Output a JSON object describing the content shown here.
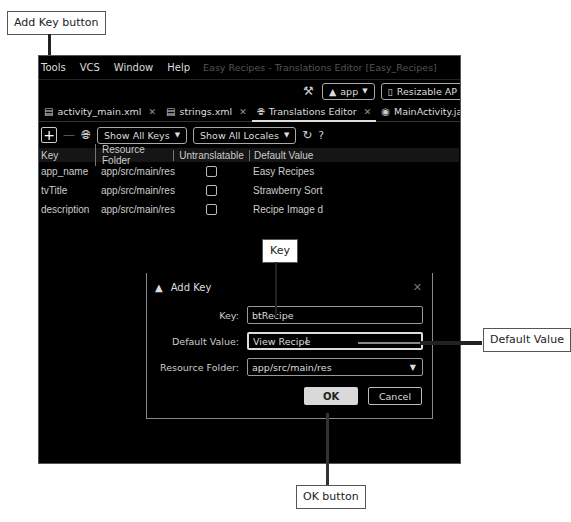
{
  "callouts": {
    "add_key_button": "Add Key button",
    "key": "Key",
    "default_value": "Default Value",
    "ok_button": "OK button"
  },
  "menubar": {
    "items": [
      "Tools",
      "VCS",
      "Window",
      "Help"
    ],
    "title": "Easy Recipes - Translations Editor [Easy_Recipes]"
  },
  "toolbar": {
    "run_config": "app",
    "device": "Resizable AP"
  },
  "tabs": [
    {
      "label": "activity_main.xml",
      "active": false
    },
    {
      "label": "strings.xml",
      "active": false
    },
    {
      "label": "Translations Editor",
      "active": true
    },
    {
      "label": "MainActivity.java",
      "active": false
    }
  ],
  "translations_toolbar": {
    "keys_filter": "Show All Keys",
    "locales_filter": "Show All Locales",
    "help": "?"
  },
  "table": {
    "columns": [
      "Key",
      "Resource Folder",
      "Untranslatable",
      "Default Value"
    ],
    "rows": [
      {
        "key": "app_name",
        "folder": "app/src/main/res",
        "untranslatable": false,
        "default": "Easy Recipes"
      },
      {
        "key": "tvTitle",
        "folder": "app/src/main/res",
        "untranslatable": false,
        "default": "Strawberry Sort"
      },
      {
        "key": "description",
        "folder": "app/src/main/res",
        "untranslatable": false,
        "default": "Recipe Image d"
      }
    ]
  },
  "dialog": {
    "title": "Add Key",
    "key_label": "Key:",
    "key_value": "btRecipe",
    "default_label": "Default Value:",
    "default_value": "View Recipe",
    "folder_label": "Resource Folder:",
    "folder_value": "app/src/main/res",
    "ok": "OK",
    "cancel": "Cancel"
  }
}
